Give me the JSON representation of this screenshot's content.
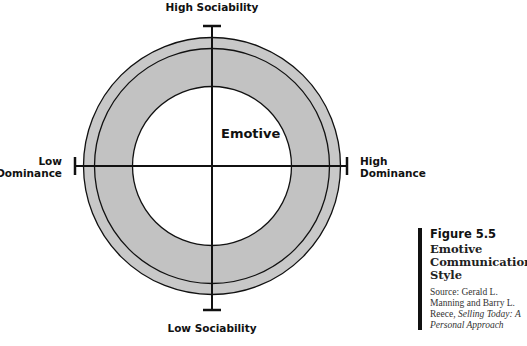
{
  "diagram": {
    "center_label": "Emotive",
    "axes": {
      "top": "High Sociability",
      "bottom": "Low Sociability",
      "left_line1": "Low",
      "left_line2": "Dominance",
      "right_line1": "High",
      "right_line2": "Dominance"
    },
    "colors": {
      "ring_outer": "#c8c8c8",
      "ring_inner": "#c2c2c2",
      "stroke": "#111111",
      "center_fill": "#ffffff"
    }
  },
  "caption": {
    "figure_number": "Figure 5.5",
    "title_line1": "Emotive",
    "title_line2": "Communication",
    "title_line3": "Style",
    "source_prefix": "Source: Gerald L. Manning and Barry L. Reece, ",
    "source_book": "Selling Today: A Personal Approach"
  }
}
